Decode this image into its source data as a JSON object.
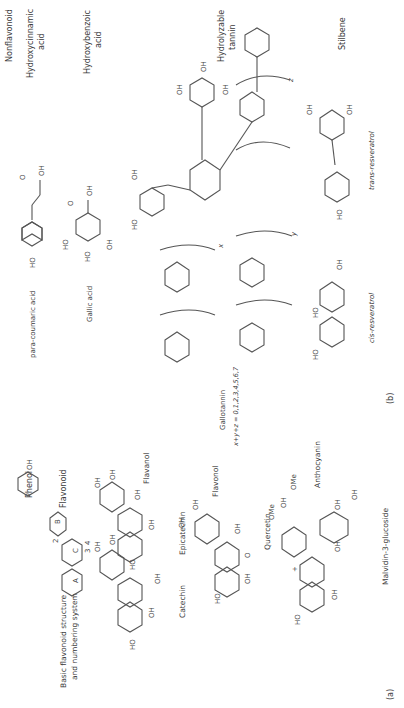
{
  "panel_a": {
    "label": "(a)",
    "phenol": "Phenol",
    "flavonoid_class": "Flavonoid",
    "basic_structure_line1": "Basic flavonoid structure",
    "basic_structure_line2": "and numbering system",
    "ring_labels": [
      "A",
      "B",
      "C"
    ],
    "numbering": [
      "2",
      "3",
      "4",
      "5",
      "6",
      "7",
      "8",
      "1'",
      "2'",
      "3'",
      "4'",
      "5'",
      "6'"
    ],
    "catechin": "Catechin",
    "epicatechin": "Epicatechin",
    "flavanol_1": "Flavanol",
    "quercetin": "Quercetin",
    "flavonol": "Flavonol",
    "malvidin": "Malvidin-3-glucoside",
    "anthocyanin": "Anthocyanin"
  },
  "panel_b": {
    "label": "(b)",
    "nonflavonoid": "Nonflavonoid",
    "hydroxycinnamic_line1": "Hydroxycinnamic",
    "hydroxycinnamic_line2": "acid",
    "hydroxybenzoic_line1": "Hydroxybenzoic",
    "hydroxybenzoic_line2": "acid",
    "para_coumaric": "para-coumaric acid",
    "gallic_acid": "Gallic acid",
    "hydrolyzable_line1": "Hydrolyzable",
    "hydrolyzable_line2": "tannin",
    "gallotannin": "Gallotannin",
    "gallotannin_formula": "x+y+z = 0,1,2,3,4,5,6,7",
    "stilbene": "Stilbene",
    "trans_resveratrol": "trans-resveratrol",
    "cis_resveratrol": "cis-resveratrol",
    "subscripts": [
      "x",
      "y",
      "z"
    ]
  },
  "atoms": {
    "OH": "OH",
    "HO": "HO",
    "O": "O",
    "C": "C",
    "OMe": "OMe"
  }
}
